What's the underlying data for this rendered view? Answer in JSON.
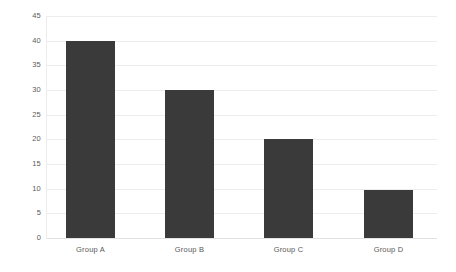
{
  "chart_data": {
    "type": "bar",
    "title": "",
    "subtitle": "",
    "xlabel": "",
    "ylabel": "",
    "categories": [
      "Group A",
      "Group B",
      "Group C",
      "Group D"
    ],
    "values": [
      40,
      30,
      20,
      9.7
    ],
    "series": [
      {
        "name": "",
        "values": [
          40,
          30,
          20,
          9.7
        ]
      }
    ],
    "ylim": [
      0,
      45
    ],
    "ytick_step": 5,
    "yticks": [
      0,
      5,
      10,
      15,
      20,
      25,
      30,
      35,
      40,
      45
    ],
    "ytick_labels": [
      "0",
      "5",
      "10",
      "15",
      "20",
      "25",
      "30",
      "35",
      "40",
      "45"
    ],
    "grid": true,
    "grid_axis": "y",
    "legend": false,
    "legend_position": "none",
    "annotations": [],
    "data_labels": false,
    "colors": {
      "bar": "#3A3A3A",
      "gridline": "#EDEDED",
      "baseline": "#E2E2E2",
      "tick_label": "#595959",
      "background": "#FFFFFF"
    }
  }
}
